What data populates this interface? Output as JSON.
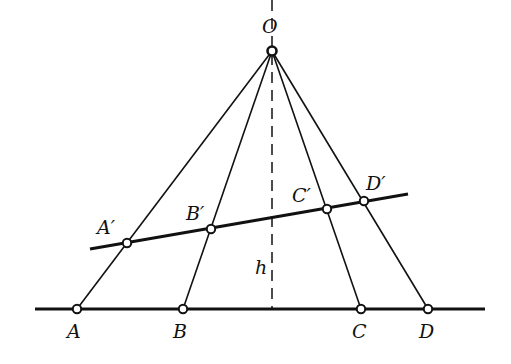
{
  "diagram": {
    "type": "projective-geometry",
    "stroke_color": "#111111",
    "apex": {
      "label": "O",
      "x": 272,
      "y": 51
    },
    "baseline": {
      "x1": 35,
      "y1": 309,
      "x2": 485,
      "y2": 309
    },
    "transversal": {
      "x1": 90,
      "y1": 249,
      "x2": 408,
      "y2": 194
    },
    "height": {
      "label": "h",
      "x": 272,
      "y1": 58,
      "y2": 309
    },
    "base_points": [
      {
        "label": "A",
        "x": 77,
        "y": 309
      },
      {
        "label": "B",
        "x": 183,
        "y": 309
      },
      {
        "label": "C",
        "x": 361,
        "y": 309
      },
      {
        "label": "D",
        "x": 428,
        "y": 309
      }
    ],
    "projected_points": [
      {
        "label": "A′",
        "x": 127,
        "y": 243
      },
      {
        "label": "B′",
        "x": 211,
        "y": 229
      },
      {
        "label": "C′",
        "x": 327,
        "y": 209
      },
      {
        "label": "D′",
        "x": 364,
        "y": 201
      }
    ]
  }
}
